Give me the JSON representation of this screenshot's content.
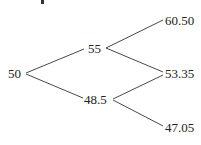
{
  "diagram": {
    "type": "binomial-tree",
    "nodes": {
      "root": "50",
      "up": "55",
      "down": "48.5",
      "up_up": "60.50",
      "up_down": "53.35",
      "down_down": "47.05"
    },
    "edges": [
      [
        "root",
        "up"
      ],
      [
        "root",
        "down"
      ],
      [
        "up",
        "up_up"
      ],
      [
        "up",
        "up_down"
      ],
      [
        "down",
        "up_down"
      ],
      [
        "down",
        "down_down"
      ]
    ]
  }
}
